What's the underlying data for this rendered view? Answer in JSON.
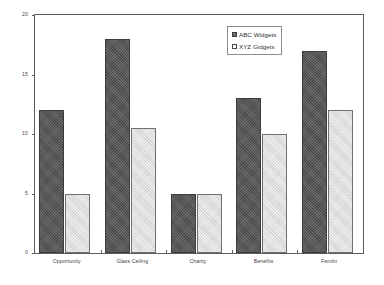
{
  "chart_data": {
    "type": "bar",
    "title": "",
    "subtitle": "",
    "xlabel": "",
    "ylabel": "",
    "ylim": [
      0,
      20
    ],
    "yticks": [
      0,
      5,
      10,
      15,
      20
    ],
    "ytick_labels": [
      "0",
      "5",
      "10",
      "15",
      "20"
    ],
    "grid": false,
    "legend_position": "top-right",
    "categories": [
      "Opportunity",
      "Glass Ceiling",
      "Charity",
      "Benefits",
      "Femlin"
    ],
    "series": [
      {
        "name": "ABC Widgets",
        "color": "#575757",
        "pattern": "cross-hatch",
        "values": [
          12,
          18,
          5,
          13,
          17
        ]
      },
      {
        "name": "XYZ Gidgets",
        "color": "#dcdcdc",
        "pattern": "light-hatch",
        "values": [
          5,
          10.5,
          5,
          10,
          12
        ]
      }
    ]
  },
  "legend": {
    "entries": [
      {
        "label": "ABC Widgets",
        "swatch": "filled-dark-square"
      },
      {
        "label": "XYZ Gidgets",
        "swatch": "open-light-square"
      }
    ]
  },
  "axes": {
    "y": {
      "ticks": [
        {
          "value": 20,
          "label": "20"
        },
        {
          "value": 15,
          "label": "15"
        },
        {
          "value": 10,
          "label": "10"
        },
        {
          "value": 5,
          "label": "5"
        },
        {
          "value": 0,
          "label": "0"
        }
      ]
    },
    "x": {
      "labels": [
        "Opportunity",
        "Glass Ceiling",
        "Charity",
        "Benefits",
        "Femlin"
      ]
    }
  },
  "colors": {
    "axis": "#5d5d5d",
    "series_abc": "#575757",
    "series_xyz": "#dcdcdc",
    "background": "#ffffff",
    "text": "#3f3f3f"
  }
}
